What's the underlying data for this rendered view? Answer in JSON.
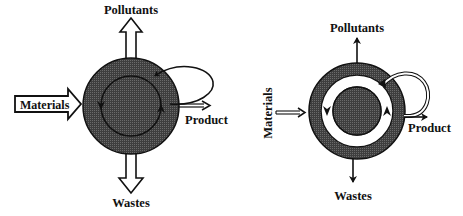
{
  "diagrams": [
    {
      "name": "open-loop-process",
      "labels": {
        "pollutants": "Pollutants",
        "materials": "Materials",
        "product": "Product",
        "wastes": "Wastes"
      },
      "arrow_style": "hollow-block",
      "inner_loop": "thin circular recycle loop"
    },
    {
      "name": "closed-loop-process",
      "labels": {
        "pollutants": "Pollutants",
        "materials": "Materials",
        "product": "Product",
        "wastes": "Wastes"
      },
      "arrow_style": "thin-line",
      "inner_loop": "wide white recycle ring"
    }
  ],
  "colors": {
    "fill": "#4a4a4a",
    "stroke": "#111111",
    "background": "#ffffff"
  }
}
